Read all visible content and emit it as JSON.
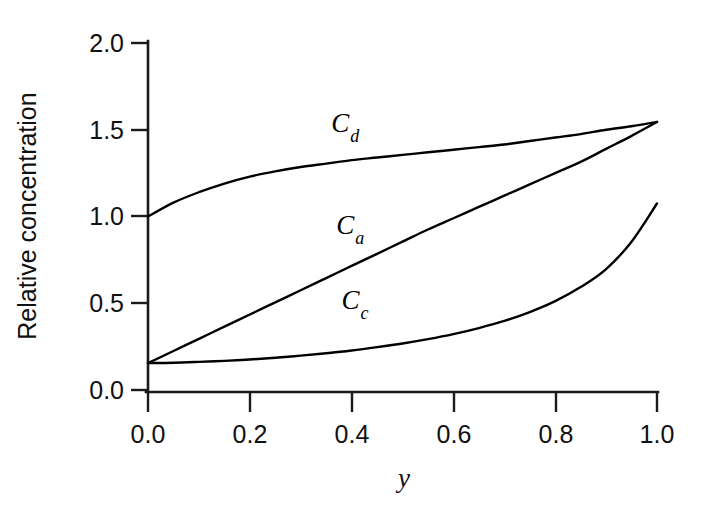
{
  "figure": {
    "background_color": "#ffffff",
    "ink_color": "#111111",
    "width": 703,
    "height": 506
  },
  "chart_data": {
    "type": "line",
    "title": "",
    "subtitle": "",
    "xlabel": "y",
    "ylabel": "Relative concentration",
    "xlim": [
      0.0,
      1.0
    ],
    "ylim": [
      0.0,
      2.0
    ],
    "grid": false,
    "legend_position": "inline-annotations",
    "xticks": [
      0.0,
      0.2,
      0.4,
      0.6,
      0.8,
      1.0
    ],
    "xtick_labels": [
      "0.0",
      "0.2",
      "0.4",
      "0.6",
      "0.8",
      "1.0"
    ],
    "yticks": [
      0.0,
      0.5,
      1.0,
      1.5,
      2.0
    ],
    "ytick_labels": [
      "0.0",
      "0.5",
      "1.0",
      "1.5",
      "2.0"
    ],
    "x": [
      0.0,
      0.05,
      0.1,
      0.15,
      0.2,
      0.25,
      0.3,
      0.35,
      0.4,
      0.45,
      0.5,
      0.55,
      0.6,
      0.65,
      0.7,
      0.75,
      0.8,
      0.85,
      0.9,
      0.95,
      1.0
    ],
    "series": [
      {
        "name": "Cd",
        "label": "C",
        "subscript": "d",
        "color": "#000000",
        "values": [
          1.0,
          1.08,
          1.14,
          1.19,
          1.23,
          1.26,
          1.285,
          1.305,
          1.325,
          1.34,
          1.355,
          1.37,
          1.385,
          1.4,
          1.415,
          1.435,
          1.455,
          1.475,
          1.5,
          1.52,
          1.545
        ],
        "annotation": {
          "x": 0.36,
          "y": 1.49
        }
      },
      {
        "name": "Ca",
        "label": "C",
        "subscript": "a",
        "color": "#000000",
        "values": [
          0.155,
          0.225,
          0.295,
          0.365,
          0.435,
          0.505,
          0.575,
          0.645,
          0.715,
          0.785,
          0.855,
          0.925,
          0.99,
          1.055,
          1.12,
          1.185,
          1.25,
          1.315,
          1.39,
          1.465,
          1.545
        ],
        "annotation": {
          "x": 0.37,
          "y": 0.9
        }
      },
      {
        "name": "Cc",
        "label": "C",
        "subscript": "c",
        "color": "#000000",
        "values": [
          0.155,
          0.157,
          0.162,
          0.168,
          0.176,
          0.186,
          0.198,
          0.212,
          0.228,
          0.247,
          0.268,
          0.293,
          0.322,
          0.357,
          0.398,
          0.449,
          0.512,
          0.593,
          0.697,
          0.855,
          1.075
        ],
        "annotation": {
          "x": 0.38,
          "y": 0.47
        }
      }
    ]
  }
}
